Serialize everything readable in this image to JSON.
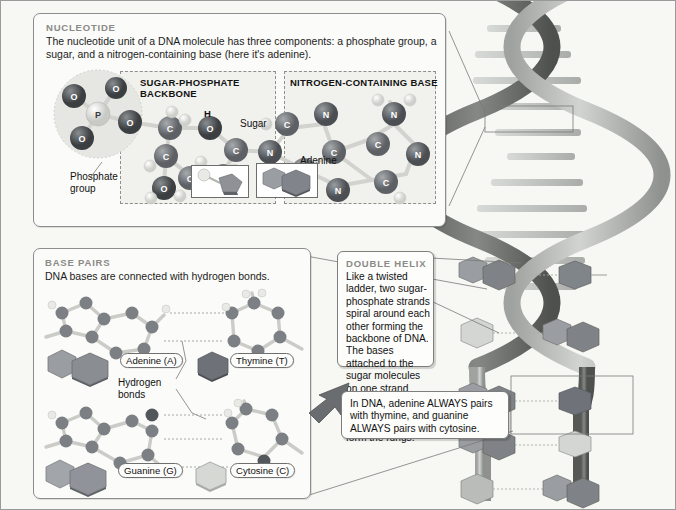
{
  "figure": {
    "background": "#f7f7f4",
    "border_color": "#9a9a9a"
  },
  "nucleotide_panel": {
    "heading": "NUCLEOTIDE",
    "description": "The nucleotide unit of a DNA molecule has three components: a phosphate group, a sugar, and a nitrogen-containing base (here it's adenine).",
    "backbone_title_line1": "SUGAR-PHOSPHATE",
    "backbone_title_line2": "BACKBONE",
    "base_title": "NITROGEN-CONTAINING BASE",
    "labels": {
      "phosphate_line1": "Phosphate",
      "phosphate_line2": "group",
      "sugar": "Sugar",
      "adenine": "Adenine",
      "hydrogen_atom": "H",
      "phosphorus_atom": "P",
      "oxygen_atom": "O",
      "carbon_atom": "C",
      "nitrogen_atom": "N"
    }
  },
  "base_pairs_panel": {
    "heading": "BASE PAIRS",
    "description": "DNA bases are connected with hydrogen bonds.",
    "hydrogen_label_line1": "Hydrogen",
    "hydrogen_label_line2": "bonds",
    "pairs": [
      {
        "left_name": "Adenine (A)",
        "left_type": "purine",
        "left_color": "#8e9196",
        "right_name": "Thymine (T)",
        "right_type": "pyrimidine",
        "right_color": "#6e7278",
        "hydrogen_bonds": 2
      },
      {
        "left_name": "Guanine (G)",
        "left_type": "purine",
        "left_color": "#9a9da1",
        "right_name": "Cytosine (C)",
        "right_type": "pyrimidine",
        "right_color": "#d6d8d4",
        "hydrogen_bonds": 3
      }
    ]
  },
  "double_helix_panel": {
    "heading": "DOUBLE HELIX",
    "description": "Like a twisted ladder, two sugar-phosphate strands spiral around each other forming the backbone of DNA. The bases attached to the sugar molecules on one strand bond to those attached to the other strand to form the rungs."
  },
  "pairing_callout": {
    "text": "In DNA, adenine ALWAYS pairs with thymine, and guanine ALWAYS pairs with cytosine."
  },
  "helix": {
    "strand_light_color": "#b7bab7",
    "strand_dark_color": "#6b6e6b",
    "rung_color": "#c9ccc8",
    "turns": 3
  },
  "palette": {
    "oxygen": "#4c4f52",
    "carbon": "#6f7276",
    "nitrogen": "#5a5d61",
    "phosphorus": "#e3e3e1",
    "hydrogen": "#e8e8e6",
    "bond": "#cfcfcb",
    "hbond": "#a8a8a4"
  }
}
